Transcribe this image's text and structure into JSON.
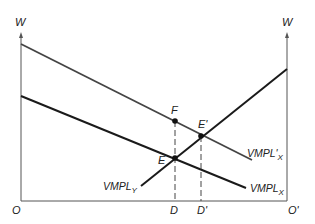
{
  "diagram": {
    "axes": {
      "left_y_label": "W",
      "right_y_label": "W",
      "origin_left": "O",
      "origin_right": "O'"
    },
    "curves": [
      {
        "id": "vmpl_x_prime",
        "label": "VMPL'",
        "subscript": "X",
        "color": "#444444"
      },
      {
        "id": "vmpl_x",
        "label": "VMPL",
        "subscript": "X",
        "color": "#1a1a1a"
      },
      {
        "id": "vmpl_y",
        "label": "VMPL",
        "subscript": "Y",
        "color": "#1a1a1a"
      }
    ],
    "points": [
      {
        "id": "F",
        "label": "F"
      },
      {
        "id": "E",
        "label": "E"
      },
      {
        "id": "E_prime",
        "label": "E'"
      }
    ],
    "x_markers": [
      {
        "id": "D",
        "label": "D"
      },
      {
        "id": "D_prime",
        "label": "D'"
      }
    ]
  }
}
